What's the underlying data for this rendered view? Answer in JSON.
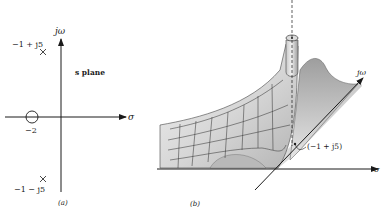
{
  "panel_a": {
    "caption": "(a)",
    "plane_label": "s plane",
    "axis_vertical": "jω",
    "axis_horizontal": "σ",
    "zero": {
      "label": "−2",
      "value": -2,
      "symbol": "circle"
    },
    "poles": [
      {
        "label": "−1 + j5",
        "re": -1,
        "im": 5,
        "symbol": "cross"
      },
      {
        "label": "−1 − j5",
        "re": -1,
        "im": -5,
        "symbol": "cross"
      }
    ]
  },
  "panel_b": {
    "caption": "(b)",
    "axis_vertical": "jω",
    "axis_horizontal": "σ",
    "pole_annotation": "(−1 + j5)"
  },
  "colors": {
    "ink": "#1a1a1a",
    "surface_light": "#eeeeee",
    "surface_mid": "#cfcfcf",
    "surface_dark": "#9a9a9a"
  }
}
